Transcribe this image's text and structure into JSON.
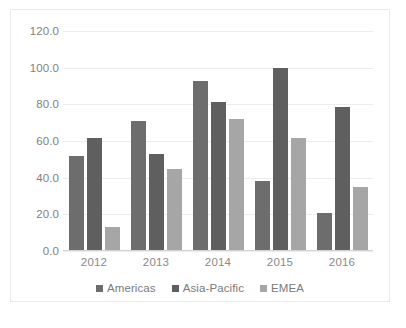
{
  "chart_data": {
    "type": "bar",
    "title": "",
    "subtitle": "",
    "xlabel": "",
    "ylabel": "",
    "categories": [
      "2012",
      "2013",
      "2014",
      "2015",
      "2016"
    ],
    "series": [
      {
        "name": "Americas",
        "color": "#6d6d6d",
        "values": [
          51.5,
          70.5,
          92.5,
          38.0,
          20.5
        ]
      },
      {
        "name": "Asia-Pacific",
        "color": "#5f5f5f",
        "values": [
          61.5,
          52.5,
          81.0,
          100.0,
          78.5
        ]
      },
      {
        "name": "EMEA",
        "color": "#a6a6a6",
        "values": [
          12.5,
          44.5,
          72.0,
          61.5,
          34.5
        ]
      }
    ],
    "ylim": [
      0.0,
      120.0
    ],
    "ytick_step": 20.0,
    "ytick_labels": [
      "120.0",
      "100.0",
      "80.0",
      "60.0",
      "40.0",
      "20.0",
      "0.0"
    ],
    "ytick_values": [
      120.0,
      100.0,
      80.0,
      60.0,
      40.0,
      20.0,
      0.0
    ],
    "grid": true,
    "grid_axis": "y",
    "legend": true,
    "legend_position": "bottom",
    "grid_color": "#ececee",
    "axis_label_color": "#7f7f7f",
    "plot_background": "#ffffff",
    "border_color": "#e9e9ec"
  },
  "legend": {
    "items": [
      {
        "label": "Americas"
      },
      {
        "label": "Asia-Pacific"
      },
      {
        "label": "EMEA"
      }
    ]
  }
}
